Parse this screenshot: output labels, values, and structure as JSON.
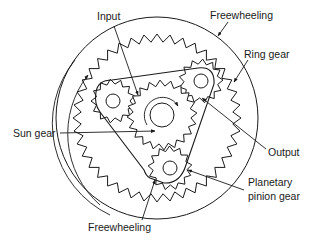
{
  "diagram": {
    "labels": {
      "input": "Input",
      "freewheeling_top": "Freewheeling",
      "ring_gear": "Ring gear",
      "sun_gear": "Sun gear",
      "output": "Output",
      "planetary_pinion_gear": "Planetary pinion gear",
      "freewheeling_bottom": "Freewheeling"
    },
    "components": [
      {
        "id": "outer-housing",
        "shape": "circle",
        "cx": 157,
        "cy": 118,
        "r": 101
      },
      {
        "id": "ring-gear",
        "shape": "internal-gear",
        "cx": 157,
        "cy": 118,
        "r": 80,
        "teeth": 40
      },
      {
        "id": "sun-gear",
        "shape": "external-gear",
        "cx": 162,
        "cy": 115,
        "r": 35,
        "teeth": 20
      },
      {
        "id": "sun-hub",
        "shape": "circle",
        "cx": 162,
        "cy": 115,
        "r": 12
      },
      {
        "id": "planet-pinion-upper-left",
        "shape": "external-gear",
        "cx": 113,
        "cy": 101,
        "r": 21,
        "hole_r": 7
      },
      {
        "id": "planet-pinion-upper-right",
        "shape": "external-gear",
        "cx": 201,
        "cy": 81,
        "r": 21,
        "hole_r": 7
      },
      {
        "id": "planet-pinion-bottom",
        "shape": "external-gear",
        "cx": 170,
        "cy": 168,
        "r": 21,
        "hole_r": 7
      },
      {
        "id": "planet-carrier",
        "shape": "rounded-triangle"
      }
    ],
    "colors": {
      "line": "#1a1a1a",
      "background": "#ffffff"
    }
  }
}
